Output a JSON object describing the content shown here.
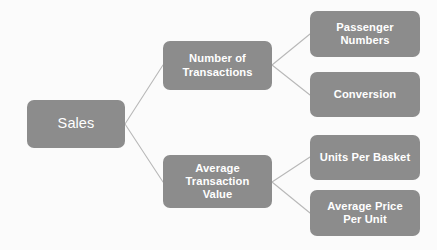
{
  "diagram": {
    "type": "tree",
    "orientation": "left-to-right",
    "background_color": "#fbfbfb",
    "node_fill_color": "#8c8c8c",
    "node_text_color": "#ffffff",
    "connector_color": "#b8b8b8",
    "nodes": [
      {
        "id": "sales",
        "label": "Sales",
        "level": 1,
        "parent": null
      },
      {
        "id": "number-of-transactions",
        "label": "Number of\nTransactions",
        "level": 2,
        "parent": "sales"
      },
      {
        "id": "average-transaction-value",
        "label": "Average\nTransaction\nValue",
        "level": 2,
        "parent": "sales"
      },
      {
        "id": "passenger-numbers",
        "label": "Passenger\nNumbers",
        "level": 3,
        "parent": "number-of-transactions"
      },
      {
        "id": "conversion",
        "label": "Conversion",
        "level": 3,
        "parent": "number-of-transactions"
      },
      {
        "id": "units-per-basket",
        "label": "Units Per Basket",
        "level": 3,
        "parent": "average-transaction-value"
      },
      {
        "id": "average-price-per-unit",
        "label": "Average Price\nPer Unit",
        "level": 3,
        "parent": "average-transaction-value"
      }
    ],
    "edges": [
      {
        "from": "sales",
        "to": "number-of-transactions"
      },
      {
        "from": "sales",
        "to": "average-transaction-value"
      },
      {
        "from": "number-of-transactions",
        "to": "passenger-numbers"
      },
      {
        "from": "number-of-transactions",
        "to": "conversion"
      },
      {
        "from": "average-transaction-value",
        "to": "units-per-basket"
      },
      {
        "from": "average-transaction-value",
        "to": "average-price-per-unit"
      }
    ]
  }
}
